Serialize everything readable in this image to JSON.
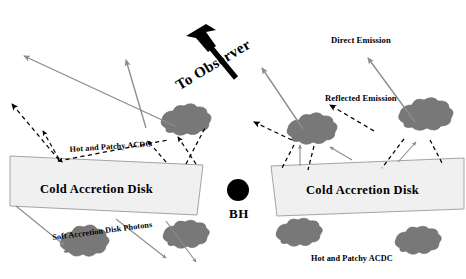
{
  "figure": {
    "width": 466,
    "height": 279,
    "background": "#ffffff"
  },
  "colors": {
    "blob_fill": "#787878",
    "blob_stroke": "#6b6b6b",
    "disk_fill": "#f0f0f0",
    "disk_stroke": "#9a9a9a",
    "solid_arrow": "#8c8c8c",
    "dashed_arrow": "#000000",
    "black_hole": "#000000",
    "text": "#000000"
  },
  "labels": {
    "to_observer": "To Observer",
    "direct_emission": "Direct Emission",
    "reflected_emission": "Reflected Emission",
    "hot_patchy_acdc_left": "Hot and Patchy ACDC",
    "hot_patchy_acdc_right": "Hot and Patchy ACDC",
    "soft_disk_photons": "Soft Accretion Disk Photons",
    "cold_disk_left": "Cold Accretion Disk",
    "cold_disk_right": "Cold Accretion Disk",
    "black_hole": "BH"
  },
  "icons": {
    "observer_arrow": "big-black-arrow-icon",
    "black_hole_marker": "black-hole-circle-icon",
    "corona_blob": "corona-blob-icon",
    "emission_arrow": "solid-gray-arrow-icon",
    "scatter_arrow": "dashed-black-arrow-icon"
  },
  "geometry": {
    "disk_left_points": "10,156 203,165 197,215 10,206",
    "disk_right_points": "271,166 464,158 464,209 277,216",
    "black_hole": {
      "cx": 238,
      "cy": 190,
      "r": 11
    }
  }
}
